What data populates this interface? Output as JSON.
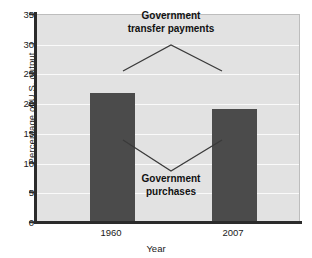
{
  "chart_data": {
    "type": "bar",
    "title": "",
    "categories": [
      "1960",
      "2007"
    ],
    "series": [
      {
        "name": "Government purchases",
        "values": [
          21.8,
          19.0
        ]
      }
    ],
    "values": [
      21.8,
      19.0
    ],
    "xlabel": "Year",
    "ylabel": "Percentage of U.S. output",
    "ylim": [
      0,
      35
    ],
    "ytick_values": [
      0,
      5,
      10,
      15,
      20,
      25,
      30,
      35
    ],
    "ytick_labels": [
      "0",
      "5",
      "10",
      "15",
      "20",
      "25",
      "30",
      "35"
    ],
    "grid": true,
    "legend_position": "none",
    "annotations": [
      {
        "text": "Government transfer payments",
        "line1": "Government",
        "line2": "transfer payments",
        "kind": "bracket-up",
        "points": [
          [
            123,
            71
          ],
          [
            171,
            45
          ],
          [
            222,
            71
          ]
        ]
      },
      {
        "text": "Government purchases",
        "line1": "Government",
        "line2": "purchases",
        "kind": "bracket-down",
        "points": [
          [
            123,
            140
          ],
          [
            171,
            171
          ],
          [
            222,
            140
          ]
        ]
      }
    ],
    "colors": {
      "bar": "#4b4b4b",
      "plot_background": "#e2e2e2",
      "gridline": "#fafafa",
      "axis": "#2b2b2b",
      "text": "#1a1a1a",
      "annotation_line": "#3a3a3a"
    }
  }
}
